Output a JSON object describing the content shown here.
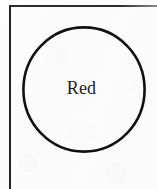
{
  "figure": {
    "kind": "labeled-circle-diagram",
    "width": 157,
    "height": 189,
    "background_color": "#fdfdfd",
    "ink_color": "#111113"
  },
  "frame": {
    "name": "page-border",
    "visible_edges": "top-and-left",
    "stroke_color": "#2c2c2e",
    "stroke_width": 2
  },
  "circle": {
    "label": "Red",
    "stroke_color": "#111113",
    "stroke_width": 2.6,
    "fill": "none",
    "center_x": 84,
    "center_y": 89,
    "diameter": 124
  },
  "label": {
    "text": "Red",
    "color": "#1e1e20",
    "font_size_px": 18
  }
}
